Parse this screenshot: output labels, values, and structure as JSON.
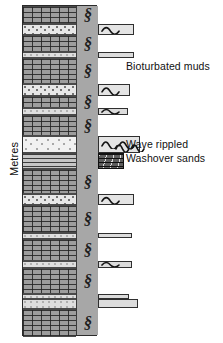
{
  "figure": {
    "axis_label": "Metres",
    "column": {
      "left": 22,
      "top": 5,
      "width": 75,
      "height": 331
    }
  },
  "annotations": [
    {
      "id": "bioturbated-muds",
      "text": "Bioturbated muds"
    },
    {
      "id": "wave-rippled",
      "text": "Wave rippled"
    },
    {
      "id": "washover-sands",
      "text": "Washover sands"
    }
  ],
  "symbols": {
    "bioturbation": "§",
    "bioturbation_name": "bioturbation-symbol",
    "ripple_name": "wave-ripple-symbol"
  },
  "colors": {
    "mud": "#9d9d9d",
    "sand": "#e7e7e7",
    "clean_sand": "#f1f1f1",
    "laminated": "#c6c6c6",
    "bio_strip": "#a7a7a7",
    "outline": "#2b2b2b",
    "bar_fill": "#e4e4e4",
    "dark_bar": "#5e5e5e",
    "text": "#111111",
    "background": "#ffffff"
  },
  "chart_data": {
    "type": "table",
    "ylabel": "Metres",
    "grid": false,
    "legend": "none",
    "lithology_key": [
      {
        "code": "mud",
        "label": "Bioturbated mud"
      },
      {
        "code": "sand",
        "label": "Sand"
      },
      {
        "code": "sand-thin",
        "label": "Thin sand stringer"
      },
      {
        "code": "sand-clean",
        "label": "Clean washover sand"
      },
      {
        "code": "laminated",
        "label": "Parallel laminated sand"
      }
    ],
    "beds": [
      {
        "top": 0,
        "height": 18,
        "lithology": "mud",
        "bioturbated": true,
        "rippled": false,
        "bar": null
      },
      {
        "top": 18,
        "height": 11,
        "lithology": "sand",
        "bioturbated": false,
        "rippled": true,
        "bar": {
          "width": 36,
          "height": 11,
          "style": "normal"
        }
      },
      {
        "top": 29,
        "height": 17,
        "lithology": "mud",
        "bioturbated": true,
        "rippled": false,
        "bar": null
      },
      {
        "top": 46,
        "height": 6,
        "lithology": "sand-thin",
        "bioturbated": false,
        "rippled": false,
        "bar": {
          "width": 36,
          "height": 6,
          "style": "thin"
        }
      },
      {
        "top": 52,
        "height": 26,
        "lithology": "mud",
        "bioturbated": true,
        "rippled": false,
        "bar": null
      },
      {
        "top": 78,
        "height": 12,
        "lithology": "sand",
        "bioturbated": false,
        "rippled": true,
        "bar": {
          "width": 32,
          "height": 12,
          "style": "normal"
        }
      },
      {
        "top": 90,
        "height": 12,
        "lithology": "mud",
        "bioturbated": true,
        "rippled": false,
        "bar": null
      },
      {
        "top": 102,
        "height": 7,
        "lithology": "sand-thin",
        "bioturbated": false,
        "rippled": true,
        "bar": {
          "width": 30,
          "height": 7,
          "style": "thin"
        }
      },
      {
        "top": 109,
        "height": 21,
        "lithology": "mud",
        "bioturbated": true,
        "rippled": false,
        "bar": null
      },
      {
        "top": 130,
        "height": 17,
        "lithology": "sand-clean",
        "bioturbated": false,
        "rippled": true,
        "bar": {
          "width": 42,
          "height": 17,
          "style": "normal"
        }
      },
      {
        "top": 147,
        "height": 16,
        "lithology": "laminated",
        "bioturbated": false,
        "rippled": false,
        "bar": {
          "width": 26,
          "height": 16,
          "style": "dark"
        }
      },
      {
        "top": 163,
        "height": 25,
        "lithology": "mud",
        "bioturbated": true,
        "rippled": false,
        "bar": null
      },
      {
        "top": 188,
        "height": 11,
        "lithology": "sand",
        "bioturbated": false,
        "rippled": true,
        "bar": {
          "width": 36,
          "height": 11,
          "style": "normal"
        }
      },
      {
        "top": 199,
        "height": 28,
        "lithology": "mud",
        "bioturbated": true,
        "rippled": false,
        "bar": null
      },
      {
        "top": 227,
        "height": 6,
        "lithology": "sand-thin",
        "bioturbated": false,
        "rippled": false,
        "bar": {
          "width": 34,
          "height": 5,
          "style": "thin"
        }
      },
      {
        "top": 233,
        "height": 22,
        "lithology": "mud",
        "bioturbated": true,
        "rippled": false,
        "bar": null
      },
      {
        "top": 255,
        "height": 7,
        "lithology": "sand-thin",
        "bioturbated": false,
        "rippled": true,
        "bar": {
          "width": 34,
          "height": 7,
          "style": "thin"
        }
      },
      {
        "top": 262,
        "height": 26,
        "lithology": "mud",
        "bioturbated": true,
        "rippled": false,
        "bar": null
      },
      {
        "top": 288,
        "height": 5,
        "lithology": "sand-thin",
        "bioturbated": false,
        "rippled": false,
        "bar": {
          "width": 31,
          "height": 5,
          "style": "thin"
        }
      },
      {
        "top": 293,
        "height": 10,
        "lithology": "sand-thin",
        "bioturbated": false,
        "rippled": false,
        "bar": {
          "width": 40,
          "height": 9,
          "style": "thin"
        }
      },
      {
        "top": 303,
        "height": 28,
        "lithology": "mud",
        "bioturbated": true,
        "rippled": false,
        "bar": null
      }
    ]
  }
}
